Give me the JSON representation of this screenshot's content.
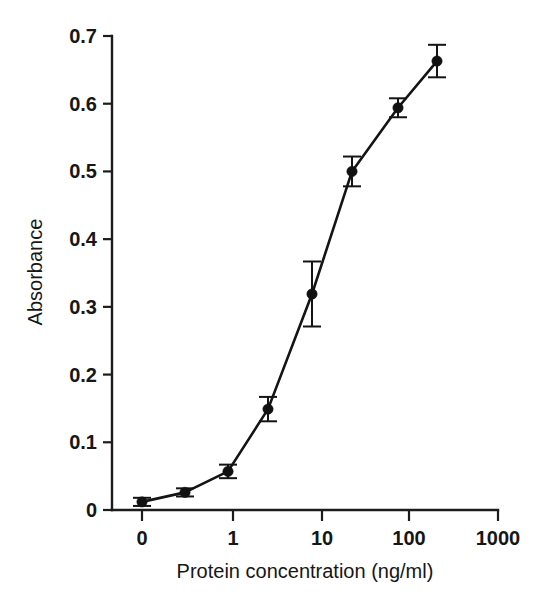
{
  "figure": {
    "background_color": "#ffffff",
    "ink_color": "#141414"
  },
  "chart_data": {
    "type": "line",
    "title": "",
    "subtitle": "",
    "xlabel": "Protein concentration (ng/ml)",
    "ylabel": "Absorbance",
    "x_scale": "log-with-zero",
    "x_tick_labels": [
      "0",
      "1",
      "10",
      "100",
      "1000"
    ],
    "x_tick_values": [
      0,
      1,
      10,
      100,
      1000
    ],
    "y_tick_labels": [
      "0",
      "0.1",
      "0.2",
      "0.3",
      "0.4",
      "0.5",
      "0.6",
      "0.7"
    ],
    "y_tick_values": [
      0,
      0.1,
      0.2,
      0.3,
      0.4,
      0.5,
      0.6,
      0.7
    ],
    "ylim": [
      0,
      0.7
    ],
    "grid": false,
    "legend": false,
    "legend_position": "none",
    "marker_style": "filled-circle",
    "error_bars": "symmetric-vertical",
    "categories": [
      "0",
      "0.3",
      "0.9",
      "2.7",
      "8.2",
      "25",
      "74",
      "220"
    ],
    "x": [
      0,
      0.3,
      0.9,
      2.7,
      8.2,
      25,
      74,
      220
    ],
    "values": [
      0.012,
      0.026,
      0.057,
      0.149,
      0.319,
      0.5,
      0.594,
      0.663
    ],
    "errors": [
      0.006,
      0.006,
      0.01,
      0.018,
      0.048,
      0.022,
      0.014,
      0.024
    ],
    "series": [
      {
        "name": "Absorbance",
        "values": [
          0.012,
          0.026,
          0.057,
          0.149,
          0.319,
          0.5,
          0.594,
          0.663
        ],
        "errors": [
          0.006,
          0.006,
          0.01,
          0.018,
          0.048,
          0.022,
          0.014,
          0.024
        ]
      }
    ],
    "points": [
      {
        "x_label": "0",
        "px": 142,
        "y": 0.012,
        "err": 0.006
      },
      {
        "x_label": "0.3",
        "px": 185,
        "y": 0.026,
        "err": 0.006
      },
      {
        "x_label": "0.9",
        "px": 228,
        "y": 0.057,
        "err": 0.01
      },
      {
        "x_label": "2.7",
        "px": 268,
        "y": 0.149,
        "err": 0.018
      },
      {
        "x_label": "8.2",
        "px": 312,
        "y": 0.319,
        "err": 0.048
      },
      {
        "x_label": "25",
        "px": 352,
        "y": 0.5,
        "err": 0.022
      },
      {
        "x_label": "74",
        "px": 398,
        "y": 0.594,
        "err": 0.014
      },
      {
        "x_label": "220",
        "px": 437,
        "y": 0.663,
        "err": 0.024
      }
    ],
    "x_tick_pixels": [
      142,
      233,
      322,
      409,
      498
    ]
  }
}
